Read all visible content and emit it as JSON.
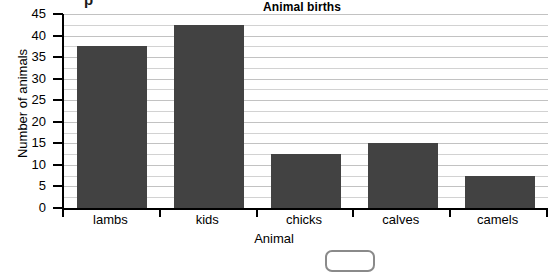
{
  "page": {
    "cutoff_text_top": "p",
    "background_color": "#ffffff"
  },
  "answer_box": {
    "name": "answer-input",
    "value": "",
    "border_color": "#8a8a8a"
  },
  "chart_data": {
    "type": "bar",
    "title": "Animal births",
    "xlabel": "Animal",
    "ylabel": "Number of animals",
    "categories": [
      "lambs",
      "kids",
      "chicks",
      "calves",
      "camels"
    ],
    "values": [
      37.5,
      42.5,
      12.5,
      15,
      7.5
    ],
    "ylim": [
      0,
      45
    ],
    "ytick_labels": [
      "0",
      "5",
      "10",
      "15",
      "20",
      "25",
      "30",
      "35",
      "40",
      "45"
    ],
    "ytick_values": [
      0,
      5,
      10,
      15,
      20,
      25,
      30,
      35,
      40,
      45
    ],
    "major_tick_step": 5,
    "minor_grid_step": 2.5,
    "grid": true,
    "legend": "none",
    "bar_color": "#424242",
    "grid_color": "#d2d2d2",
    "axis_color": "#000000"
  }
}
